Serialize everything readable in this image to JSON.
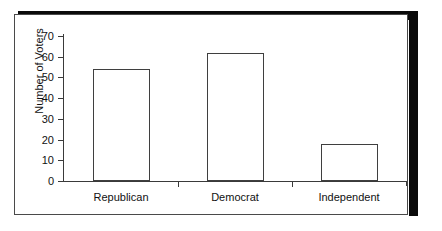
{
  "chart_data": {
    "type": "bar",
    "title": "",
    "xlabel": "",
    "ylabel": "Number of Voters",
    "categories": [
      "Republican",
      "Democrat",
      "Independent"
    ],
    "values": [
      54,
      62,
      18
    ],
    "ylim": [
      0,
      70
    ],
    "ytick_labels": [
      "70",
      "60",
      "50",
      "40",
      "30",
      "20",
      "10",
      "0"
    ],
    "ytick_values": [
      70,
      60,
      50,
      40,
      30,
      20,
      10,
      0
    ],
    "ytick_step": 10,
    "grid": false,
    "legend": false,
    "bar_fill_color": "#ffffff",
    "bar_outline_color": "#3f3f3f",
    "axis_color": "#3a3a3a",
    "text_color": "#111111",
    "background_color": "#ffffff",
    "frame_border_color": "#4a4a4a",
    "shadow_color": "#0a0a0a"
  }
}
